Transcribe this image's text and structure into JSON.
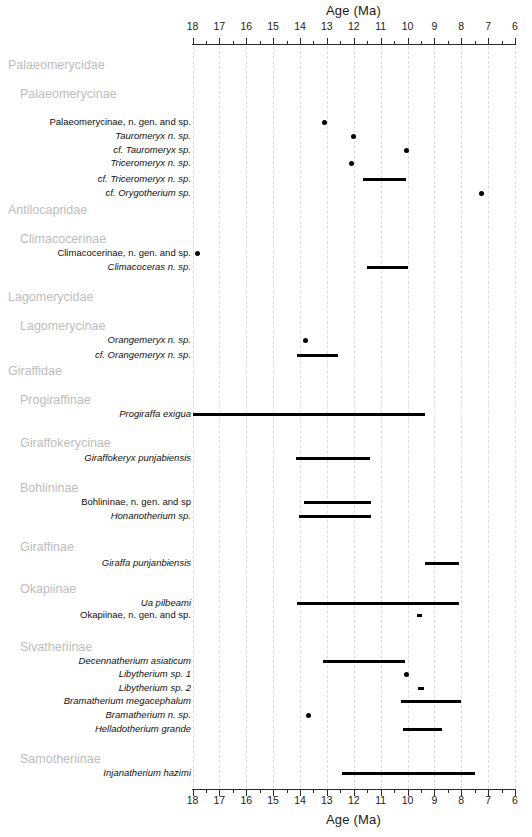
{
  "axis": {
    "title": "Age (Ma)",
    "ticks": [
      18,
      17,
      16,
      15,
      14,
      13,
      12,
      11,
      10,
      9,
      8,
      7,
      6
    ],
    "tick_labels": [
      "18",
      "17",
      "16",
      "15",
      "14",
      "13",
      "12",
      "11",
      "10",
      "9",
      "8",
      "7",
      "6"
    ],
    "min": 6,
    "max": 18,
    "reversed": true,
    "unit": "Ma",
    "px_left": 192.5,
    "px_right": 515,
    "grid": true,
    "grid_color": "#dcdcdc"
  },
  "colors": {
    "mark": "#000000",
    "group_label": "#bdbdbd",
    "taxon_label": "#111111",
    "axis": "#2a2a2a"
  },
  "chart_data": {
    "type": "bar",
    "title": "Age (Ma)",
    "xlabel": "Age (Ma)",
    "ylabel": "",
    "xlim": [
      18,
      6
    ],
    "grid": true,
    "legend": null,
    "orientation": "horizontal-range",
    "note": "Stratigraphic range chart: horizontal bars are first/last occurrence ranges (Ma); dots are single occurrences.",
    "rows": [
      {
        "kind": "group",
        "rank": "family",
        "label": "Palaeomerycidae",
        "y": 58
      },
      {
        "kind": "group",
        "rank": "subfamily",
        "label": "Palaeomerycinae",
        "y": 87
      },
      {
        "kind": "taxon",
        "label": "Palaeomerycinae, n. gen. and sp.",
        "italic": false,
        "y": 115,
        "mark": "point",
        "value": 13.1
      },
      {
        "kind": "taxon",
        "label": "Tauromeryx n. sp.",
        "italic": true,
        "roman_tail": " n. sp.",
        "y": 129,
        "mark": "point",
        "value": 12.0
      },
      {
        "kind": "taxon",
        "label": "cf. Tauromeryx  sp.",
        "italic": true,
        "y": 143,
        "mark": "point",
        "value": 10.05
      },
      {
        "kind": "taxon",
        "label": "Triceromeryx n. sp.",
        "italic": true,
        "y": 156,
        "mark": "point",
        "value": 12.1
      },
      {
        "kind": "taxon",
        "label": "cf. Triceromeryx n. sp.",
        "italic": true,
        "y": 172,
        "mark": "range",
        "start": 11.65,
        "end": 10.05
      },
      {
        "kind": "taxon",
        "label": "cf. Orygotherium sp.",
        "italic": true,
        "y": 186,
        "mark": "point",
        "value": 7.25
      },
      {
        "kind": "group",
        "rank": "family",
        "label": "Antilocapridae",
        "y": 203
      },
      {
        "kind": "group",
        "rank": "subfamily",
        "label": "Climacocerinae",
        "y": 232
      },
      {
        "kind": "taxon",
        "label": "Climacocerinae, n. gen. and sp.",
        "italic": false,
        "y": 246,
        "mark": "point",
        "value": 17.8
      },
      {
        "kind": "taxon",
        "label": "Climacoceras n. sp.",
        "italic": true,
        "y": 260,
        "mark": "range",
        "start": 11.5,
        "end": 10.0
      },
      {
        "kind": "group",
        "rank": "family",
        "label": "Lagomerycidae",
        "y": 290
      },
      {
        "kind": "group",
        "rank": "subfamily",
        "label": "Lagomerycinae",
        "y": 319
      },
      {
        "kind": "taxon",
        "label": "Orangemeryx n. sp.",
        "italic": true,
        "y": 333,
        "mark": "point",
        "value": 13.8
      },
      {
        "kind": "taxon",
        "label": "cf. Orangemeryx n. sp.",
        "italic": true,
        "y": 348,
        "mark": "range",
        "start": 14.1,
        "end": 12.6
      },
      {
        "kind": "group",
        "rank": "family",
        "label": "Giraffidae",
        "y": 364
      },
      {
        "kind": "group",
        "rank": "subfamily",
        "label": "Progiraffinae",
        "y": 393
      },
      {
        "kind": "taxon",
        "label": "Progiraffa exigua",
        "italic": true,
        "y": 407,
        "mark": "range",
        "start": 18.0,
        "end": 9.35
      },
      {
        "kind": "group",
        "rank": "subfamily",
        "label": "Giraffokerycinae",
        "y": 436
      },
      {
        "kind": "taxon",
        "label": "Giraffokeryx punjabiensis",
        "italic": true,
        "y": 451,
        "mark": "range",
        "start": 14.15,
        "end": 11.4
      },
      {
        "kind": "group",
        "rank": "subfamily",
        "label": "Bohlininae",
        "y": 481
      },
      {
        "kind": "taxon",
        "label": "Bohlininae, n. gen. and sp",
        "italic": false,
        "y": 495,
        "mark": "range",
        "start": 13.85,
        "end": 11.35
      },
      {
        "kind": "taxon",
        "label": "Honanotherium sp.",
        "italic": true,
        "y": 509,
        "mark": "range",
        "start": 14.05,
        "end": 11.35
      },
      {
        "kind": "group",
        "rank": "subfamily",
        "label": "Giraffinae",
        "y": 540
      },
      {
        "kind": "taxon",
        "label": "Giraffa punjanbiensis",
        "italic": true,
        "y": 556,
        "mark": "range",
        "start": 9.35,
        "end": 8.1
      },
      {
        "kind": "group",
        "rank": "subfamily",
        "label": "Okapiinae",
        "y": 582
      },
      {
        "kind": "taxon",
        "label": "Ua pilbeami",
        "italic": true,
        "y": 596,
        "mark": "range",
        "start": 14.1,
        "end": 8.1
      },
      {
        "kind": "taxon",
        "label": "Okapiinae, n. gen. and sp.",
        "italic": false,
        "y": 608,
        "mark": "range",
        "start": 9.65,
        "end": 9.45
      },
      {
        "kind": "group",
        "rank": "subfamily",
        "label": "Sivatheriinae",
        "y": 640
      },
      {
        "kind": "taxon",
        "label": "Decennatherium asiaticum",
        "italic": true,
        "y": 654,
        "mark": "range",
        "start": 13.15,
        "end": 10.1
      },
      {
        "kind": "taxon",
        "label": "Libytherium sp. 1",
        "italic": true,
        "y": 667,
        "mark": "point",
        "value": 10.05
      },
      {
        "kind": "taxon",
        "label": "Libytherium sp. 2",
        "italic": true,
        "y": 681,
        "mark": "range",
        "start": 9.6,
        "end": 9.4
      },
      {
        "kind": "taxon",
        "label": "Bramatherium megacephalum",
        "italic": true,
        "y": 694,
        "mark": "range",
        "start": 10.25,
        "end": 8.0
      },
      {
        "kind": "taxon",
        "label": "Bramatherium n. sp.",
        "italic": true,
        "y": 708,
        "mark": "point",
        "value": 13.7
      },
      {
        "kind": "taxon",
        "label": "Helladotherium grande",
        "italic": true,
        "y": 722,
        "mark": "range",
        "start": 10.15,
        "end": 8.7
      },
      {
        "kind": "group",
        "rank": "subfamily",
        "label": "Samotheriinae",
        "y": 752
      },
      {
        "kind": "taxon",
        "label": "Injanatherium hazimi",
        "italic": true,
        "y": 766,
        "mark": "range",
        "start": 12.45,
        "end": 7.5
      }
    ]
  }
}
